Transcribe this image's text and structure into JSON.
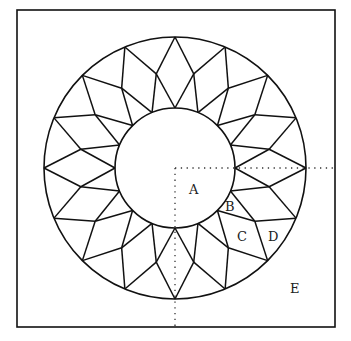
{
  "diagram": {
    "type": "quilt-block-pattern",
    "frame": {
      "x": 17,
      "y": 10,
      "width": 318,
      "height": 317
    },
    "center": {
      "x": 175,
      "y": 168
    },
    "outer_radius": 131,
    "middle_radius": 96,
    "inner_radius": 60,
    "points": 16,
    "stroke_color": "#111111",
    "labels": [
      {
        "id": "A",
        "text": "A",
        "x": 195,
        "y": 194
      },
      {
        "id": "B",
        "text": "B",
        "x": 230,
        "y": 211
      },
      {
        "id": "C",
        "text": "C",
        "x": 242,
        "y": 241
      },
      {
        "id": "D",
        "text": "D",
        "x": 274,
        "y": 241
      },
      {
        "id": "E",
        "text": "E",
        "x": 295,
        "y": 293
      }
    ]
  }
}
